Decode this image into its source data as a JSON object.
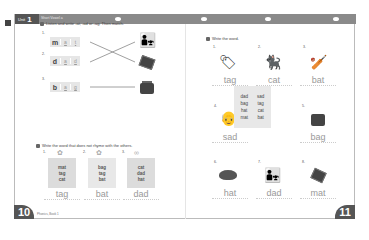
{
  "header": {
    "unit_label": "Unit",
    "unit_number": "1",
    "unit_title": "Short Vowel a"
  },
  "left_page": {
    "page_number": "10",
    "footer_text": "Phonics, Book 1",
    "exercise1": {
      "number": "5",
      "instruction": "Listen and write -at, -ad or -ag. Then match.",
      "items": [
        {
          "no": "1.",
          "onset": "m",
          "fill": [
            "a",
            "t"
          ],
          "picture": "dad-and-child"
        },
        {
          "no": "2.",
          "onset": "d",
          "fill": [
            "a",
            "d"
          ],
          "picture": "mat"
        },
        {
          "no": "3.",
          "onset": "b",
          "fill": [
            "a",
            "g"
          ],
          "picture": "bag"
        }
      ]
    },
    "exercise2": {
      "number": "6",
      "instruction": "Write the word that does not rhyme with the others.",
      "items": [
        {
          "no": "1.",
          "words": [
            "mat",
            "tag",
            "cat"
          ],
          "answer": "tag"
        },
        {
          "no": "2.",
          "words": [
            "bag",
            "tag",
            "bat"
          ],
          "answer": "bat"
        },
        {
          "no": "3.",
          "words": [
            "cat",
            "dad",
            "hat"
          ],
          "answer": "dad"
        }
      ]
    }
  },
  "right_page": {
    "page_number": "11",
    "exercise": {
      "number": "7",
      "instruction": "Write the word.",
      "items": [
        {
          "no": "1.",
          "picture": "tag",
          "answer": "tag"
        },
        {
          "no": "2.",
          "picture": "cat",
          "answer": "cat"
        },
        {
          "no": "3.",
          "picture": "bat",
          "answer": "bat"
        },
        {
          "no": "4.",
          "picture": "sad-man",
          "answer": "sad"
        },
        {
          "no": "5.",
          "picture": "bag",
          "answer": "bag"
        },
        {
          "no": "6.",
          "picture": "hat",
          "answer": "hat"
        },
        {
          "no": "7.",
          "picture": "dad",
          "answer": "dad"
        },
        {
          "no": "8.",
          "picture": "mat",
          "answer": "mat"
        }
      ],
      "word_bank": [
        "dad",
        "sad",
        "bag",
        "tag",
        "hat",
        "cat",
        "mat",
        "bat"
      ]
    }
  },
  "colors": {
    "header_band": "#8a8a8a",
    "unit_tag": "#555555",
    "box_fill": "#e6e6e6"
  }
}
